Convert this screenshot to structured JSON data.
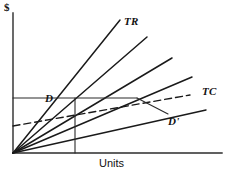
{
  "figure": {
    "kind": "economics-line-diagram",
    "background_color": "#ffffff",
    "line_color": "#1a1a1a"
  },
  "axes": {
    "y_axis_label": "$",
    "x_axis_label": "Units",
    "origin_px": [
      13,
      153
    ],
    "y_axis_top_px": [
      13,
      13
    ],
    "x_axis_right_px": [
      222,
      153
    ]
  },
  "labels": {
    "total_revenue": "TR",
    "total_cost": "TC",
    "demand": "D",
    "demand_prime": "D'",
    "units": "Units",
    "dollars": "$"
  },
  "chart_data": {
    "type": "line",
    "title": "",
    "xlabel": "Units",
    "ylabel": "$",
    "xlim": [
      0,
      222
    ],
    "ylim": [
      0,
      153
    ],
    "grid": false,
    "legend": "inline-annotations",
    "series": [
      {
        "name": "TR",
        "style": "solid",
        "role": "total-revenue-ray-steepest",
        "points": [
          [
            13,
            153
          ],
          [
            120,
            20
          ]
        ]
      },
      {
        "name": "revenue-ray-2",
        "style": "solid",
        "role": "total-revenue-ray",
        "points": [
          [
            13,
            153
          ],
          [
            147,
            37
          ]
        ]
      },
      {
        "name": "revenue-ray-3",
        "style": "solid",
        "role": "total-revenue-ray",
        "points": [
          [
            13,
            153
          ],
          [
            172,
            58
          ]
        ]
      },
      {
        "name": "revenue-ray-4",
        "style": "solid",
        "role": "total-revenue-ray",
        "points": [
          [
            13,
            153
          ],
          [
            192,
            77
          ]
        ]
      },
      {
        "name": "revenue-ray-5",
        "style": "solid",
        "role": "total-revenue-ray-flattest",
        "points": [
          [
            13,
            153
          ],
          [
            206,
            110
          ]
        ]
      },
      {
        "name": "TC",
        "style": "dashed",
        "role": "total-cost-curve",
        "points": [
          [
            13,
            126
          ],
          [
            190,
            95
          ]
        ]
      },
      {
        "name": "demand-horizontal",
        "style": "solid",
        "role": "price-level-line-through-D",
        "points": [
          [
            13,
            98
          ],
          [
            137,
            98
          ]
        ]
      },
      {
        "name": "demand-segment-D-to-Dprime",
        "style": "solid",
        "role": "demand-curve-descending",
        "points": [
          [
            137,
            98
          ],
          [
            168,
            114
          ]
        ]
      },
      {
        "name": "quantity-vertical",
        "style": "solid",
        "role": "quantity-marker",
        "points": [
          [
            75,
            98
          ],
          [
            75,
            153
          ]
        ]
      }
    ],
    "annotations": [
      {
        "text": "TR",
        "x": 124,
        "y": 22,
        "style": "italic-serif-bold"
      },
      {
        "text": "TC",
        "x": 202,
        "y": 92,
        "style": "italic-serif-bold"
      },
      {
        "text": "D",
        "x": 45,
        "y": 99,
        "style": "italic-serif-bold"
      },
      {
        "text": "D'",
        "x": 168,
        "y": 122,
        "style": "italic-serif-bold"
      },
      {
        "text": "Units",
        "x": 99,
        "y": 166,
        "style": "sans"
      },
      {
        "text": "$",
        "x": 4,
        "y": 9,
        "style": "serif-bold"
      }
    ]
  }
}
